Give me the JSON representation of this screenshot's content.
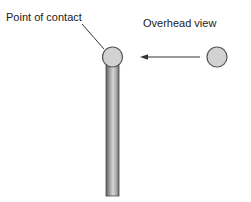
{
  "diagram": {
    "labels": {
      "point_of_contact": "Point of contact",
      "overhead_view": "Overhead view"
    },
    "colors": {
      "fill": "#cfcfcf",
      "stroke": "#555555",
      "rod_dark": "#6e6e6e",
      "rod_light": "#d8d8d8",
      "line": "#333333"
    },
    "elements": [
      {
        "type": "rod",
        "description": "vertical cylindrical rod"
      },
      {
        "type": "circle",
        "description": "ball at top of rod (point of contact)"
      },
      {
        "type": "circle",
        "description": "ball in overhead view"
      },
      {
        "type": "arrow",
        "direction": "left",
        "description": "arrow pointing from overhead-view ball toward contact ball"
      },
      {
        "type": "leader-line",
        "description": "line connecting label to point of contact"
      }
    ]
  }
}
